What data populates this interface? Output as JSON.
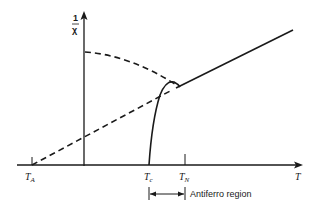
{
  "diagram": {
    "y_axis_label": {
      "numerator": "1",
      "denominator": "χ"
    },
    "x_axis_label": "T",
    "ticks": [
      {
        "name": "T_A",
        "main": "T",
        "sub": "A"
      },
      {
        "name": "T_c",
        "main": "T",
        "sub": "c"
      },
      {
        "name": "T_N",
        "main": "T",
        "sub": "N"
      }
    ],
    "region_label": "Antiferro region",
    "colors": {
      "ink": "#1a1a1a",
      "background": "#ffffff"
    }
  }
}
